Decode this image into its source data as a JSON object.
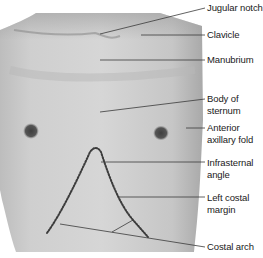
{
  "figure": {
    "colors": {
      "background": "#ffffff",
      "skin_light": "#d9d9d9",
      "skin_mid": "#c4c4c4",
      "skin_dark": "#a8a8a8",
      "nipple": "#4a4a4a",
      "leader_line": "#3a3a3a",
      "dotted_outline": "#3c3c3c",
      "label_text": "#1a1a1a"
    },
    "labels": [
      {
        "id": "jugular-notch",
        "text": "Jugular notch",
        "top": 2
      },
      {
        "id": "clavicle",
        "text": "Clavicle",
        "top": 29
      },
      {
        "id": "manubrium",
        "text": "Manubrium",
        "top": 54
      },
      {
        "id": "body-of-sternum",
        "text": "Body of\nsternum",
        "top": 93
      },
      {
        "id": "anterior-axillary-fold",
        "text": "Anterior\naxillary fold",
        "top": 122
      },
      {
        "id": "infrasternal-angle",
        "text": "Infrasternal\nangle",
        "top": 157
      },
      {
        "id": "left-costal-margin",
        "text": "Left costal\nmargin",
        "top": 192
      },
      {
        "id": "costal-arch",
        "text": "Costal arch",
        "top": 241
      }
    ]
  }
}
